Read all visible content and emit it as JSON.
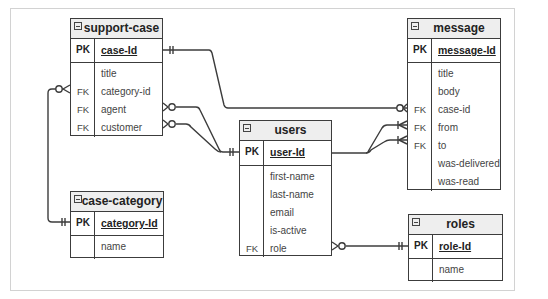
{
  "diagram": {
    "type": "entity-relationship",
    "entities": {
      "support_case": {
        "name": "support-case",
        "pk": {
          "key": "PK",
          "name": "case-Id"
        },
        "fields": [
          {
            "key": "",
            "name": "title"
          },
          {
            "key": "FK",
            "name": "category-id"
          },
          {
            "key": "FK",
            "name": "agent"
          },
          {
            "key": "FK",
            "name": "customer"
          }
        ]
      },
      "case_category": {
        "name": "case-category",
        "pk": {
          "key": "PK",
          "name": "category-Id"
        },
        "fields": [
          {
            "key": "",
            "name": "name"
          }
        ]
      },
      "users": {
        "name": "users",
        "pk": {
          "key": "PK",
          "name": "user-Id"
        },
        "fields": [
          {
            "key": "",
            "name": "first-name"
          },
          {
            "key": "",
            "name": "last-name"
          },
          {
            "key": "",
            "name": "email"
          },
          {
            "key": "",
            "name": "is-active"
          },
          {
            "key": "FK",
            "name": "role"
          }
        ]
      },
      "message": {
        "name": "message",
        "pk": {
          "key": "PK",
          "name": "message-Id"
        },
        "fields": [
          {
            "key": "",
            "name": "title"
          },
          {
            "key": "",
            "name": "body"
          },
          {
            "key": "FK",
            "name": "case-id"
          },
          {
            "key": "FK",
            "name": "from"
          },
          {
            "key": "FK",
            "name": "to"
          },
          {
            "key": "",
            "name": "was-delivered"
          },
          {
            "key": "",
            "name": "was-read"
          }
        ]
      },
      "roles": {
        "name": "roles",
        "pk": {
          "key": "PK",
          "name": "role-Id"
        },
        "fields": [
          {
            "key": "",
            "name": "name"
          }
        ]
      }
    },
    "relationships": [
      {
        "from": "support-case.category-id",
        "from_card": "zero-or-many",
        "to": "case-category.category-Id",
        "to_card": "one-and-only-one"
      },
      {
        "from": "support-case.agent",
        "from_card": "zero-or-many",
        "to": "users.user-Id",
        "to_card": "one-and-only-one"
      },
      {
        "from": "support-case.customer",
        "from_card": "zero-or-many",
        "to": "users.user-Id",
        "to_card": "one-and-only-one"
      },
      {
        "from": "message.case-id",
        "from_card": "zero-or-many",
        "to": "support-case.case-Id",
        "to_card": "one-and-only-one"
      },
      {
        "from": "message.from",
        "from_card": "one-or-many",
        "to": "users.user-Id",
        "to_card": "one"
      },
      {
        "from": "message.to",
        "from_card": "one-or-many",
        "to": "users.user-Id",
        "to_card": "one"
      },
      {
        "from": "users.role",
        "from_card": "zero-or-many",
        "to": "roles.role-Id",
        "to_card": "one-and-only-one"
      }
    ],
    "colors": {
      "line": "#3c3c3c",
      "header_bg": "#eeeeee",
      "frame": "#d2d2d2"
    }
  }
}
